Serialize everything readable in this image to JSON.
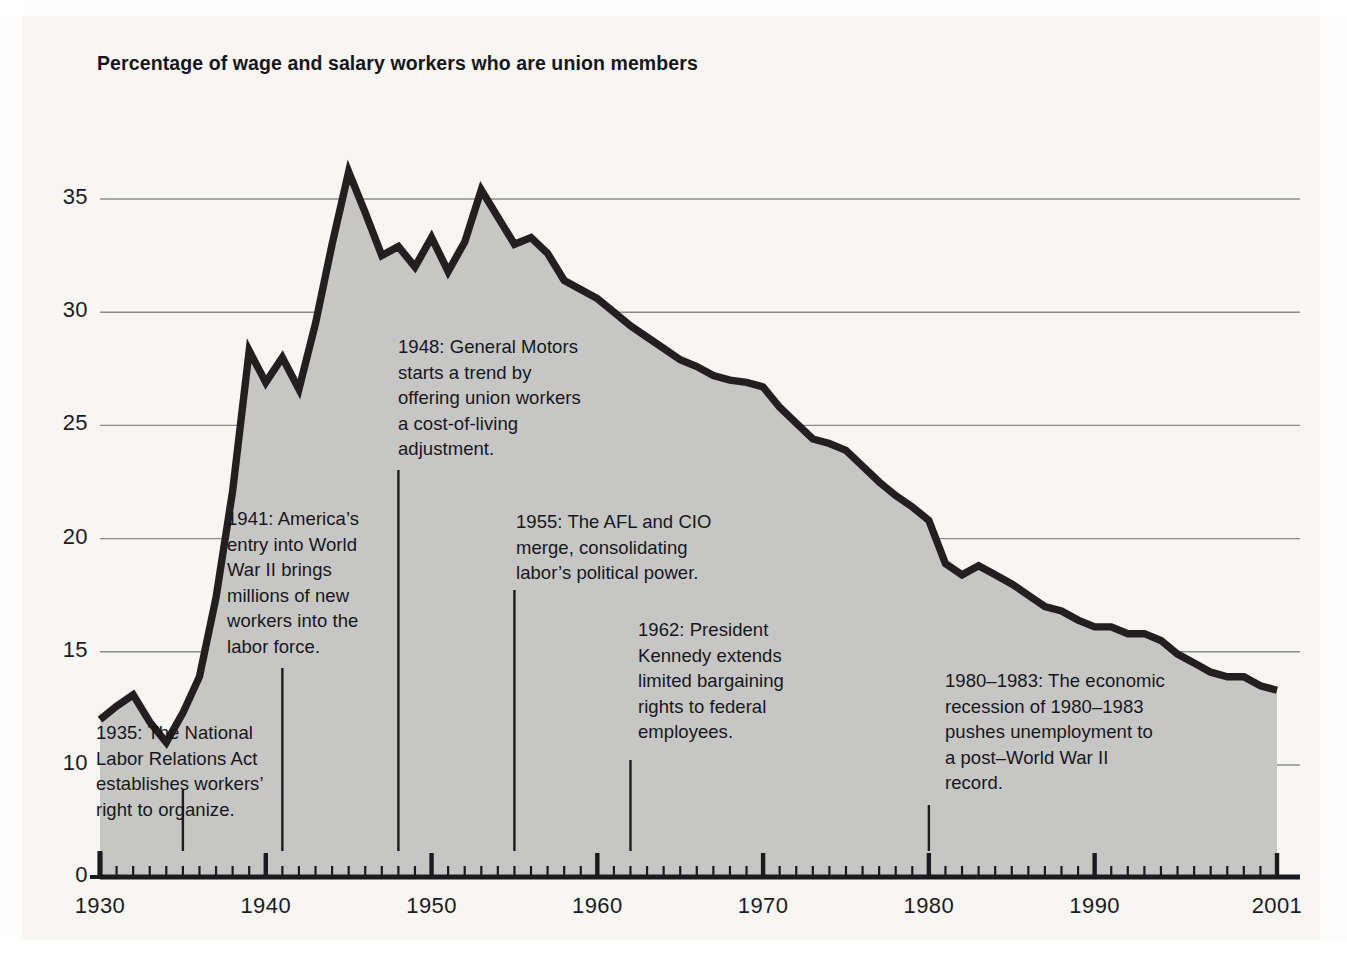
{
  "chart_data": {
    "type": "area",
    "title": "Percentage of wage and salary workers who are union members",
    "xlabel": "",
    "ylabel": "",
    "xlim": [
      1930,
      2001
    ],
    "ylim": [
      0,
      38
    ],
    "grid": true,
    "legend": "none",
    "y_ticks": [
      "0",
      "10",
      "15",
      "20",
      "25",
      "30",
      "35"
    ],
    "y_tick_values": [
      0,
      10,
      15,
      20,
      25,
      30,
      35
    ],
    "y_axis_note": "broken axis: scale jumps from 0 to 10",
    "x_ticks": [
      "1930",
      "1940",
      "1950",
      "1960",
      "1970",
      "1980",
      "1990",
      "2001"
    ],
    "x_tick_values": [
      1930,
      1940,
      1950,
      1960,
      1970,
      1980,
      1990,
      2001
    ],
    "x_minor_tick_interval": 1,
    "series_name": "Union membership rate",
    "line_color": "#231f20",
    "fill_color": "#c6c6c4",
    "x": [
      1930,
      1931,
      1932,
      1933,
      1934,
      1935,
      1936,
      1937,
      1938,
      1939,
      1940,
      1941,
      1942,
      1943,
      1944,
      1945,
      1946,
      1947,
      1948,
      1949,
      1950,
      1951,
      1952,
      1953,
      1954,
      1955,
      1956,
      1957,
      1958,
      1959,
      1960,
      1961,
      1962,
      1963,
      1964,
      1965,
      1966,
      1967,
      1968,
      1969,
      1970,
      1971,
      1972,
      1973,
      1974,
      1975,
      1976,
      1977,
      1978,
      1979,
      1980,
      1981,
      1982,
      1983,
      1984,
      1985,
      1986,
      1987,
      1988,
      1989,
      1990,
      1991,
      1992,
      1993,
      1994,
      1995,
      1996,
      1997,
      1998,
      1999,
      2000,
      2001
    ],
    "y": [
      12.0,
      12.6,
      13.1,
      11.9,
      11.0,
      12.3,
      13.9,
      17.4,
      22.1,
      28.3,
      26.9,
      28.0,
      26.6,
      29.5,
      33.0,
      36.2,
      34.4,
      32.5,
      32.9,
      32.0,
      33.3,
      31.8,
      33.1,
      35.4,
      34.2,
      33.0,
      33.3,
      32.6,
      31.4,
      31.0,
      30.6,
      30.0,
      29.4,
      28.9,
      28.4,
      27.9,
      27.6,
      27.2,
      27.0,
      26.9,
      26.7,
      25.8,
      25.1,
      24.4,
      24.2,
      23.9,
      23.2,
      22.5,
      21.9,
      21.4,
      20.8,
      18.9,
      18.4,
      18.8,
      18.4,
      18.0,
      17.5,
      17.0,
      16.8,
      16.4,
      16.1,
      16.1,
      15.8,
      15.8,
      15.5,
      14.9,
      14.5,
      14.1,
      13.9,
      13.9,
      13.5,
      13.3
    ],
    "annotations": [
      {
        "id": "1935",
        "year": 1935,
        "lines": [
          "1935: The National",
          "Labor Relations Act",
          "establishes workers’",
          "right to organize."
        ],
        "leader_from_year": 1935
      },
      {
        "id": "1941",
        "year": 1941,
        "lines": [
          "1941: America’s",
          "entry into World",
          "War II brings",
          "millions of new",
          "workers into the",
          "labor force."
        ],
        "leader_from_year": 1941
      },
      {
        "id": "1948",
        "year": 1948,
        "lines": [
          "1948: General Motors",
          "starts a trend by",
          "offering union workers",
          "a cost-of-living",
          "adjustment."
        ],
        "leader_from_year": 1948
      },
      {
        "id": "1955",
        "year": 1955,
        "lines": [
          "1955: The AFL and CIO",
          "merge, consolidating",
          "labor’s political power."
        ],
        "leader_from_year": 1955
      },
      {
        "id": "1962",
        "year": 1962,
        "lines": [
          "1962: President",
          "Kennedy extends",
          "limited bargaining",
          "rights to federal",
          "employees."
        ],
        "leader_from_year": 1962
      },
      {
        "id": "1980",
        "year": 1980,
        "lines": [
          "1980–1983: The economic",
          "recession of 1980–1983",
          "pushes unemployment to",
          "a post–World War II",
          "record."
        ],
        "leader_from_year": 1980
      }
    ]
  }
}
